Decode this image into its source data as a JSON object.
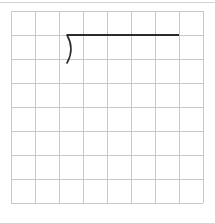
{
  "worksheet": {
    "grid": {
      "rows": 8,
      "cols": 8,
      "cell_size": 24,
      "origin_x": 11,
      "origin_y": 11,
      "line_color": "#c8c8c8"
    },
    "division_bracket": {
      "stroke_color": "#2a2a2a",
      "bar_start_x": 67,
      "bar_end_x": 179,
      "bar_y": 35,
      "curve_bottom_y": 63
    }
  }
}
